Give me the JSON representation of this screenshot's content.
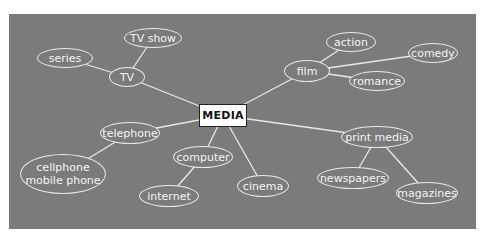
{
  "diagram": {
    "type": "mind-map",
    "root": {
      "id": "media",
      "label": "MEDIA"
    },
    "colors": {
      "panel": "#7b7b7b",
      "node_stroke": "#e8e8e8",
      "text": "#f4f4f4",
      "root_fill": "#ffffff"
    },
    "nodes": {
      "tv": {
        "label": "TV",
        "cx": 127,
        "cy": 77,
        "w": 36,
        "h": 20
      },
      "tv_show": {
        "label": "TV show",
        "cx": 153,
        "cy": 38,
        "w": 58,
        "h": 20
      },
      "series": {
        "label": "series",
        "cx": 65,
        "cy": 58,
        "w": 56,
        "h": 20
      },
      "film": {
        "label": "film",
        "cx": 307,
        "cy": 71,
        "w": 46,
        "h": 22
      },
      "action": {
        "label": "action",
        "cx": 351,
        "cy": 42,
        "w": 50,
        "h": 20
      },
      "comedy": {
        "label": "comedy",
        "cx": 433,
        "cy": 53,
        "w": 50,
        "h": 20
      },
      "romance": {
        "label": "romance",
        "cx": 377,
        "cy": 81,
        "w": 56,
        "h": 20
      },
      "telephone": {
        "label": "telephone",
        "cx": 130,
        "cy": 133,
        "w": 60,
        "h": 22
      },
      "cellphone": {
        "label": "cellphone",
        "label2": "mobile phone",
        "cx": 63,
        "cy": 174,
        "w": 86,
        "h": 40
      },
      "computer": {
        "label": "computer",
        "cx": 203,
        "cy": 157,
        "w": 60,
        "h": 22
      },
      "internet": {
        "label": "internet",
        "cx": 169,
        "cy": 196,
        "w": 60,
        "h": 22
      },
      "cinema": {
        "label": "cinema",
        "cx": 263,
        "cy": 186,
        "w": 52,
        "h": 22
      },
      "print_media": {
        "label": "print media",
        "cx": 377,
        "cy": 137,
        "w": 72,
        "h": 22
      },
      "newspapers": {
        "label": "newspapers",
        "cx": 353,
        "cy": 178,
        "w": 72,
        "h": 22
      },
      "magazines": {
        "label": "magazines",
        "cx": 427,
        "cy": 193,
        "w": 62,
        "h": 22
      }
    },
    "edges": [
      [
        "media",
        "tv"
      ],
      [
        "tv",
        "tv_show"
      ],
      [
        "tv",
        "series"
      ],
      [
        "media",
        "film"
      ],
      [
        "film",
        "action"
      ],
      [
        "film",
        "comedy"
      ],
      [
        "film",
        "romance"
      ],
      [
        "media",
        "telephone"
      ],
      [
        "telephone",
        "cellphone"
      ],
      [
        "media",
        "computer"
      ],
      [
        "computer",
        "internet"
      ],
      [
        "media",
        "cinema"
      ],
      [
        "media",
        "print_media"
      ],
      [
        "print_media",
        "newspapers"
      ],
      [
        "print_media",
        "magazines"
      ]
    ]
  }
}
